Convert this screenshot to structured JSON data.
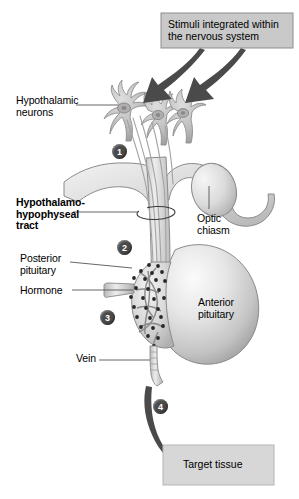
{
  "figure": {
    "background": "#ffffff"
  },
  "colors": {
    "box_fill": "#c9c9c9",
    "box_stroke": "#8d8d8d",
    "arrow": "#4a4a4a",
    "badge_fill": "#4a4a4a",
    "badge_text": "#ffffff",
    "tissue_light": "#e8e8e8",
    "tissue_mid": "#cfcfcf",
    "tissue_dark": "#a6a6a6",
    "outline": "#8a8a8a",
    "granule": "#2b2b2b",
    "leader_line": "#555555"
  },
  "boxes": [
    {
      "name": "stimuli-box",
      "text": "Stimuli integrated within\nthe nervous system",
      "x": 161,
      "y": 13,
      "w": 132,
      "h": 35
    },
    {
      "name": "target-tissue-box",
      "text": "Target tissue",
      "x": 163,
      "y": 445,
      "w": 111,
      "h": 40
    }
  ],
  "labels": [
    {
      "name": "hypothalamic-neurons-label",
      "text": "Hypothalamic\nneurons",
      "x": 16,
      "y": 95,
      "bold": false
    },
    {
      "name": "hypothalamo-hypophyseal-tract-label",
      "text": "Hypothalamo-\nhypophyseal\ntract",
      "x": 16,
      "y": 197,
      "bold": true
    },
    {
      "name": "posterior-pituitary-label",
      "text": "Posterior\npituitary",
      "x": 20,
      "y": 253,
      "bold": false
    },
    {
      "name": "hormone-label",
      "text": "Hormone",
      "x": 20,
      "y": 285,
      "bold": false
    },
    {
      "name": "vein-label",
      "text": "Vein",
      "x": 76,
      "y": 353,
      "bold": false
    },
    {
      "name": "optic-chiasm-label",
      "text": "Optic\nchiasm",
      "x": 197,
      "y": 213,
      "bold": false
    },
    {
      "name": "anterior-pituitary-label",
      "text": "Anterior\npituitary",
      "x": 198,
      "y": 297,
      "bold": false
    }
  ],
  "step_badges": [
    {
      "name": "step-badge-1",
      "number": "1",
      "x": 112,
      "y": 144
    },
    {
      "name": "step-badge-2",
      "number": "2",
      "x": 117,
      "y": 240
    },
    {
      "name": "step-badge-3",
      "number": "3",
      "x": 100,
      "y": 310
    },
    {
      "name": "step-badge-4",
      "number": "4",
      "x": 153,
      "y": 399
    }
  ],
  "anatomy": {
    "neurons_count": 3,
    "structures": [
      "hypothalamic neurons",
      "hypothalamo-hypophyseal tract",
      "infundibulum",
      "posterior pituitary",
      "anterior pituitary",
      "optic chiasm",
      "capillary bed",
      "vein"
    ]
  }
}
